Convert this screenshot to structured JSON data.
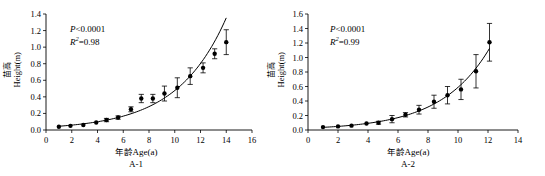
{
  "figure": {
    "name": "seedling-height-vs-age-panels",
    "panels": [
      "A-1",
      "A-2"
    ]
  },
  "chart_data": [
    {
      "type": "scatter",
      "panel_label": "A-1",
      "title": "",
      "xlabel": "年龄Age(a)",
      "ylabel_cn": "苗高",
      "ylabel_en": "Height(m)",
      "xlim": [
        0,
        16
      ],
      "ylim": [
        0,
        1.4
      ],
      "xticks": [
        0,
        2,
        4,
        6,
        8,
        10,
        12,
        14,
        16
      ],
      "xticklabels": [
        "0",
        "2",
        "4",
        "6",
        "8",
        "10",
        "12",
        "14",
        "16"
      ],
      "yticks": [
        0.0,
        0.2,
        0.4,
        0.6,
        0.8,
        1.0,
        1.2,
        1.4
      ],
      "yticklabels": [
        "0.0",
        "0.2",
        "0.4",
        "0.6",
        "0.8",
        "1.0",
        "1.2",
        "1.4"
      ],
      "grid": false,
      "legend": "none",
      "annotations": [
        {
          "text": "P<0.0001",
          "symbol": "P",
          "relation": "<",
          "value": "0.0001"
        },
        {
          "text": "R²=0.98",
          "symbol": "R2",
          "relation": "=",
          "value": "0.98"
        }
      ],
      "x": [
        1.0,
        1.9,
        2.9,
        3.9,
        4.7,
        5.6,
        6.6,
        7.4,
        8.3,
        9.2,
        10.2,
        11.2,
        12.2,
        13.1,
        14.0
      ],
      "y": [
        0.04,
        0.05,
        0.06,
        0.09,
        0.12,
        0.15,
        0.17,
        0.25,
        0.38,
        0.38,
        0.44,
        0.51,
        0.65,
        0.75,
        0.92,
        1.06
      ],
      "values": [
        0.04,
        0.05,
        0.06,
        0.09,
        0.12,
        0.15,
        0.25,
        0.38,
        0.38,
        0.44,
        0.51,
        0.65,
        0.75,
        0.92,
        1.06
      ],
      "yerr": [
        0.01,
        0.01,
        0.01,
        0.01,
        0.02,
        0.02,
        0.03,
        0.05,
        0.05,
        0.09,
        0.12,
        0.1,
        0.06,
        0.06,
        0.15
      ],
      "curve_type": "exponential"
    },
    {
      "type": "scatter",
      "panel_label": "A-2",
      "title": "",
      "xlabel": "年龄Age(a)",
      "ylabel_cn": "苗高",
      "ylabel_en": "Height(m)",
      "xlim": [
        0,
        14
      ],
      "ylim": [
        0,
        1.6
      ],
      "xticks": [
        0,
        2,
        4,
        6,
        8,
        10,
        12,
        14
      ],
      "xticklabels": [
        "0",
        "2",
        "4",
        "6",
        "8",
        "10",
        "12",
        "14"
      ],
      "yticks": [
        0.0,
        0.2,
        0.4,
        0.6,
        0.8,
        1.0,
        1.2,
        1.4,
        1.6
      ],
      "yticklabels": [
        "0.0",
        "0.2",
        "0.4",
        "0.6",
        "0.8",
        "1.0",
        "1.2",
        "1.4",
        "1.6"
      ],
      "grid": false,
      "legend": "none",
      "annotations": [
        {
          "text": "P<0.0001",
          "symbol": "P",
          "relation": "<",
          "value": "0.0001"
        },
        {
          "text": "R²=0.99",
          "symbol": "R2",
          "relation": "=",
          "value": "0.99"
        }
      ],
      "x": [
        1.0,
        2.0,
        2.9,
        3.9,
        4.7,
        5.6,
        6.5,
        7.4,
        8.4,
        9.3,
        10.2,
        11.2,
        12.1
      ],
      "values": [
        0.04,
        0.05,
        0.06,
        0.09,
        0.1,
        0.15,
        0.21,
        0.28,
        0.39,
        0.48,
        0.56,
        0.81,
        1.21
      ],
      "yerr": [
        0.01,
        0.01,
        0.01,
        0.01,
        0.02,
        0.05,
        0.03,
        0.06,
        0.09,
        0.12,
        0.14,
        0.23,
        0.26
      ],
      "curve_type": "exponential"
    }
  ],
  "panel_a1": {
    "caption": "A-1",
    "stat_p": "P<0.0001",
    "stat_p_symbol": "P",
    "stat_p_rest": "<0.0001",
    "stat_r_symbol": "R",
    "stat_r_sup": "2",
    "stat_r_rest": "=0.98",
    "ylabel_cn": "苗高",
    "ylabel_en": "Height(m)",
    "xlabel_cn": "年龄",
    "xlabel_en": "Age(a)"
  },
  "panel_a2": {
    "caption": "A-2",
    "stat_p": "P<0.0001",
    "stat_p_symbol": "P",
    "stat_p_rest": "<0.0001",
    "stat_r_symbol": "R",
    "stat_r_sup": "2",
    "stat_r_rest": "=0.99",
    "ylabel_cn": "苗高",
    "ylabel_en": "Height(m)",
    "xlabel_cn": "年龄",
    "xlabel_en": "Age(a)"
  },
  "colors": {
    "ink": "#000000",
    "background": "#ffffff"
  }
}
